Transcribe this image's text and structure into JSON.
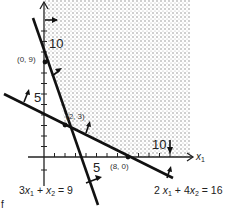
{
  "diagram": {
    "type": "linear-programming-feasible-region",
    "axes": {
      "x_label": "x",
      "x_label_sub": "1",
      "y_label": "",
      "x_ticks": [
        "5",
        "10"
      ],
      "y_ticks": [
        "5",
        "10"
      ]
    },
    "constraints": [
      {
        "id": "c1",
        "lhs_a": "3",
        "var1": "x",
        "sub1": "1",
        "op": " + ",
        "lhs_b": "",
        "var2": "x",
        "sub2": "2",
        "rhs": " = 9",
        "direction": "≥"
      },
      {
        "id": "c2",
        "lhs_a": "2 ",
        "var1": "x",
        "sub1": "1",
        "op": " + ",
        "lhs_b": "4",
        "var2": "x",
        "sub2": "2",
        "rhs": "  =  16",
        "direction": "≥"
      }
    ],
    "points": [
      {
        "label": "(0,  9)"
      },
      {
        "label": "(2,  3)"
      },
      {
        "label": "(8,  0)"
      }
    ],
    "feasible_region": {
      "shaded": true,
      "pattern": "dotted",
      "color": "#9a9a9a"
    },
    "corner_glyph": "f"
  }
}
